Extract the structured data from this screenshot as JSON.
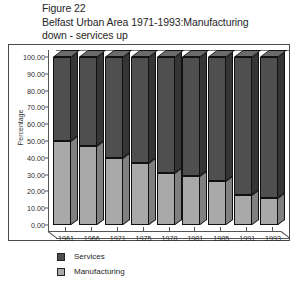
{
  "title": {
    "line1": "Figure 22",
    "line2": "Belfast Urban Area 1971-1993:Manufacturing",
    "line3": "down - services up"
  },
  "legend": {
    "services_label": "Services",
    "manufacturing_label": "Manufacturing"
  },
  "colors": {
    "services": "#4f4f4f",
    "manufacturing": "#a9a9a9",
    "frame": "#4a4a4a",
    "axis": "#555555"
  },
  "chart_data": {
    "type": "bar",
    "stacked": true,
    "percent": true,
    "title": "Belfast Urban Area 1971-1993:Manufacturing down - services up",
    "figure_label": "Figure 22",
    "xlabel": "",
    "ylabel": "Percentage",
    "ylim": [
      0,
      100
    ],
    "yticks": [
      "0.00",
      "10.00",
      "20.00",
      "30.00",
      "40.00",
      "50.00",
      "60.00",
      "70.00",
      "80.00",
      "90.00",
      "100.00"
    ],
    "ytick_values": [
      0,
      10,
      20,
      30,
      40,
      50,
      60,
      70,
      80,
      90,
      100
    ],
    "grid": false,
    "legend_position": "below-left",
    "categories": [
      "1961",
      "1966",
      "1971",
      "1975",
      "1978",
      "1981",
      "1985",
      "1991",
      "1993"
    ],
    "series": [
      {
        "name": "Manufacturing",
        "color": "#a9a9a9",
        "values": [
          50,
          47,
          40,
          37,
          31,
          29,
          26,
          18,
          16
        ]
      },
      {
        "name": "Services",
        "color": "#4f4f4f",
        "values": [
          50,
          53,
          60,
          63,
          69,
          71,
          74,
          82,
          84
        ]
      }
    ]
  }
}
